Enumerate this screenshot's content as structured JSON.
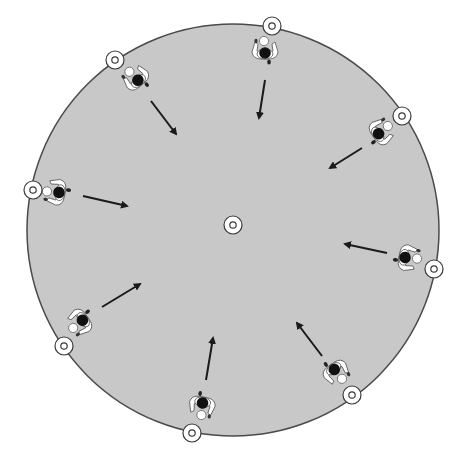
{
  "diagram": {
    "type": "drill-formation",
    "colors": {
      "background": "#ffffff",
      "field": "#c8c8c8",
      "field_stroke": "#4a4a4a",
      "marker_fill": "#ffffff",
      "marker_stroke": "#3a3a3a",
      "arrow": "#1a1a1a",
      "player_head": "#111111",
      "player_body": "#ffffff",
      "ball": "#ffffff"
    },
    "field": {
      "cx": 233,
      "cy": 230,
      "r": 206
    },
    "center_marker": {
      "x": 233,
      "y": 225,
      "label": "center-cone"
    },
    "perimeter_markers": [
      {
        "id": "top",
        "x": 272,
        "y": 26
      },
      {
        "id": "top-left",
        "x": 115,
        "y": 60
      },
      {
        "id": "top-right",
        "x": 402,
        "y": 116
      },
      {
        "id": "left",
        "x": 33,
        "y": 190
      },
      {
        "id": "right",
        "x": 434,
        "y": 269
      },
      {
        "id": "bottom-left",
        "x": 64,
        "y": 346
      },
      {
        "id": "bottom-right",
        "x": 352,
        "y": 395
      },
      {
        "id": "bottom",
        "x": 192,
        "y": 433
      }
    ],
    "players": [
      {
        "id": "top",
        "x": 265,
        "y": 50,
        "rotation": 180,
        "arrow": {
          "x1": 265,
          "y1": 80,
          "x2": 259,
          "y2": 118
        }
      },
      {
        "id": "top-left",
        "x": 136,
        "y": 78,
        "rotation": 140,
        "arrow": {
          "x1": 151,
          "y1": 101,
          "x2": 176,
          "y2": 134
        }
      },
      {
        "id": "top-right",
        "x": 381,
        "y": 132,
        "rotation": 235,
        "arrow": {
          "x1": 362,
          "y1": 148,
          "x2": 330,
          "y2": 168
        }
      },
      {
        "id": "left",
        "x": 56,
        "y": 192,
        "rotation": 100,
        "arrow": {
          "x1": 83,
          "y1": 196,
          "x2": 127,
          "y2": 206
        }
      },
      {
        "id": "right",
        "x": 408,
        "y": 258,
        "rotation": 280,
        "arrow": {
          "x1": 387,
          "y1": 253,
          "x2": 345,
          "y2": 244
        }
      },
      {
        "id": "bottom-left",
        "x": 80,
        "y": 322,
        "rotation": 55,
        "arrow": {
          "x1": 102,
          "y1": 307,
          "x2": 140,
          "y2": 284
        }
      },
      {
        "id": "bottom-right",
        "x": 336,
        "y": 372,
        "rotation": 325,
        "arrow": {
          "x1": 322,
          "y1": 356,
          "x2": 297,
          "y2": 323
        }
      },
      {
        "id": "bottom",
        "x": 202,
        "y": 406,
        "rotation": 10,
        "arrow": {
          "x1": 206,
          "y1": 380,
          "x2": 213,
          "y2": 338
        }
      }
    ]
  }
}
